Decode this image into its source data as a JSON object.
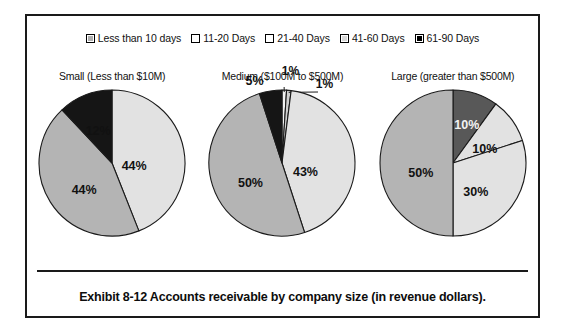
{
  "legend": {
    "items": [
      {
        "label": "Less than 10 days",
        "color": "#b0b0b0"
      },
      {
        "label": "11-20 Days",
        "color": "#ffffff"
      },
      {
        "label": "21-40 Days",
        "color": "#ffffff"
      },
      {
        "label": "41-60 Days",
        "color": "#d8d8d8"
      },
      {
        "label": "61-90 Days",
        "color": "#000000"
      }
    ]
  },
  "caption": "Exhibit 8-12 Accounts receivable by company size (in revenue dollars).",
  "chart_data": [
    {
      "type": "pie",
      "title": "Small (Less than $10M)",
      "categories": [
        "Less than 10 days",
        "11-20 Days",
        "41-60 Days",
        "61-90 Days"
      ],
      "labels": [
        "44%",
        "44%",
        "12%"
      ],
      "values": [
        44,
        44,
        12
      ],
      "slices": [
        {
          "label": "44%",
          "value": 44,
          "color": "#e2e2e2",
          "label_color": "dark",
          "label_x": 98,
          "label_y": 79
        },
        {
          "label": "44%",
          "value": 44,
          "color": "#b4b4b4",
          "label_color": "dark",
          "label_y": 103,
          "label_x": 48
        },
        {
          "label": "12%",
          "value": 12,
          "color": "#151515",
          "label_color": "dark",
          "label_x": 62,
          "label_y": 44
        }
      ]
    },
    {
      "type": "pie",
      "title": "Medium ($100M to $500M)",
      "categories": [
        "Less than 10 days",
        "11-20 Days",
        "21-40 Days",
        "41-60 Days",
        "61-90 Days"
      ],
      "labels": [
        "1%",
        "1%",
        "43%",
        "50%",
        "5%"
      ],
      "values": [
        1,
        1,
        43,
        50,
        5
      ],
      "slices": [
        {
          "label": "1%",
          "value": 1,
          "color": "#f2f2f2",
          "label_color": "dark",
          "label_x": 84,
          "label_y": -16,
          "leader": true
        },
        {
          "label": "1%",
          "value": 1,
          "color": "#cfcfcf",
          "label_color": "dark",
          "label_x": 118,
          "label_y": -3,
          "leader": true
        },
        {
          "label": "43%",
          "value": 43,
          "color": "#e2e2e2",
          "label_color": "dark",
          "label_x": 99,
          "label_y": 85
        },
        {
          "label": "50%",
          "value": 50,
          "color": "#b4b4b4",
          "label_color": "dark",
          "label_x": 44,
          "label_y": 96
        },
        {
          "label": "5%",
          "value": 5,
          "color": "#151515",
          "label_color": "dark",
          "label_x": 48,
          "label_y": -6
        }
      ]
    },
    {
      "type": "pie",
      "title": "Large (greater than $500M)",
      "categories": [
        "Less than 10 days",
        "11-20 Days",
        "21-40 Days",
        "41-60 Days"
      ],
      "labels": [
        "10%",
        "10%",
        "30%",
        "50%"
      ],
      "values": [
        10,
        10,
        30,
        50
      ],
      "slices": [
        {
          "label": "10%",
          "value": 10,
          "color": "#585858",
          "label_color": "light",
          "label_x": 90,
          "label_y": 38
        },
        {
          "label": "10%",
          "value": 10,
          "color": "#e2e2e2",
          "label_color": "dark",
          "label_x": 108,
          "label_y": 62
        },
        {
          "label": "30%",
          "value": 30,
          "color": "#e2e2e2",
          "label_color": "dark",
          "label_x": 99,
          "label_y": 105
        },
        {
          "label": "50%",
          "value": 50,
          "color": "#b4b4b4",
          "label_color": "dark",
          "label_x": 44,
          "label_y": 86
        }
      ]
    }
  ]
}
